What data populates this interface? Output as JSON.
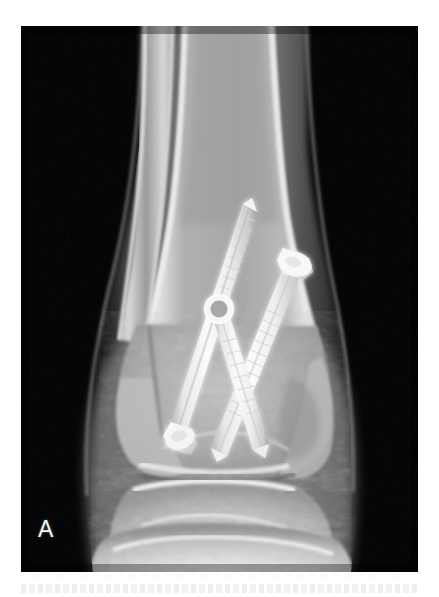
{
  "figure": {
    "panel_label": "A",
    "modality": "radiograph",
    "view": "anteroposterior ankle",
    "background_color": "#ffffff",
    "film_background_color": "#000000",
    "film": {
      "x": 21,
      "y": 26,
      "width": 397,
      "height": 546
    }
  },
  "palette": {
    "film_black": "#000000",
    "soft_tissue_dark": "#3a3a3a",
    "soft_tissue_mid": "#6e6e6e",
    "soft_tissue_light": "#8f8f8f",
    "cancellous_bone": "#b4b4b4",
    "cortical_bone": "#e2e2e2",
    "dense_bone": "#f2f2f2",
    "metal_implant": "#fbfbfb",
    "metal_shadow": "#c8c8c8",
    "label_white": "#f2f2f2"
  },
  "anatomy": {
    "bones": [
      {
        "name": "tibia-shaft",
        "label": "Tibia (distal shaft)",
        "region": "upper-center"
      },
      {
        "name": "fibula-shaft",
        "label": "Fibula (distal shaft)",
        "region": "upper-left"
      },
      {
        "name": "medial-malleolus",
        "label": "Medial malleolus",
        "region": "mid-left"
      },
      {
        "name": "lateral-malleolus",
        "label": "Lateral malleolus",
        "region": "mid-right"
      },
      {
        "name": "talus",
        "label": "Talus / talar dome",
        "region": "lower-center"
      },
      {
        "name": "calcaneus",
        "label": "Calcaneus",
        "region": "bottom"
      }
    ],
    "joint_spaces": [
      {
        "name": "tibiotalar-joint",
        "label": "Tibiotalar joint space"
      },
      {
        "name": "syndesmosis",
        "label": "Tibiofibular syndesmosis"
      }
    ]
  },
  "hardware": {
    "type": "cannulated screw fixation",
    "screw_count": 3,
    "screws": [
      {
        "id": "screw-1",
        "label": "Long oblique screw (superolateral to inferomedial)",
        "head": {
          "x": 142,
          "y": 385
        },
        "tip": {
          "x": 232,
          "y": 183
        },
        "head_style": "flanged-countersunk",
        "length_px": 221
      },
      {
        "id": "screw-2",
        "label": "Oblique screw (superolateral head to inferomedial tip)",
        "head": {
          "x": 272,
          "y": 230
        },
        "tip": {
          "x": 200,
          "y": 420
        },
        "head_style": "rounded-cap",
        "length_px": 203
      },
      {
        "id": "screw-3",
        "label": "Short screw with washer (medial)",
        "head": {
          "x": 198,
          "y": 282
        },
        "tip": {
          "x": 235,
          "y": 418
        },
        "head_style": "circular-washer",
        "length_px": 141
      }
    ],
    "washer": {
      "id": "screw-washer",
      "center": {
        "x": 198,
        "y": 282
      },
      "outer_radius": 13,
      "inner_radius": 6
    }
  },
  "caption": {
    "visible_text": "",
    "note": "faint partially-cropped caption band below image"
  }
}
